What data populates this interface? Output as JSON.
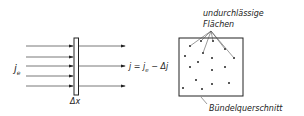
{
  "left_diagram": {
    "incident_label": "j",
    "incident_sub": "e",
    "thickness_label": "Δx",
    "transmitted_label": "j = j",
    "transmitted_sub": "e",
    "transmitted_tail": " − Δj"
  },
  "right_diagram": {
    "top_label_line1": "undurchlässige",
    "top_label_line2": "Flächen",
    "bottom_label": "Bündelquerschnitt"
  },
  "colors": {
    "ink": "#222222",
    "background": "#ffffff"
  }
}
